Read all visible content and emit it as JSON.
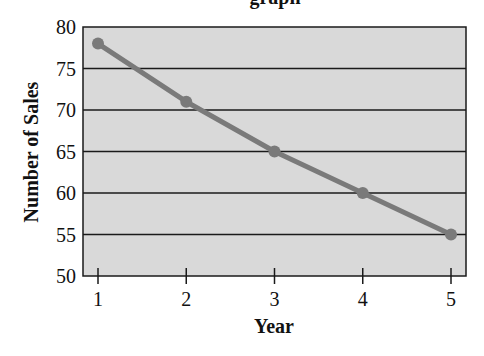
{
  "chart_data": {
    "type": "line",
    "xlabel": "Year",
    "ylabel": "Number of Sales",
    "x": [
      1,
      2,
      3,
      4,
      5
    ],
    "categories": [
      "1",
      "2",
      "3",
      "4",
      "5"
    ],
    "series": [
      {
        "name": "Number of Sales",
        "values": [
          78,
          71,
          65,
          60,
          55
        ]
      }
    ],
    "ylim": [
      50,
      80
    ],
    "yticks": [
      50,
      55,
      60,
      65,
      70,
      75,
      80
    ],
    "xticks": [
      1,
      2,
      3,
      4,
      5
    ],
    "grid": "horizontal",
    "legend": "none",
    "colors": {
      "plot_background": "#d9d9d9",
      "line": "#7a7a7a",
      "marker": "#7a7a7a",
      "gridline": "#1a1a1a",
      "frame": "#1a1a1a"
    }
  },
  "labels": {
    "title_visible_fragment": "graph",
    "xlabel": "Year",
    "ylabel": "Number of Sales"
  }
}
